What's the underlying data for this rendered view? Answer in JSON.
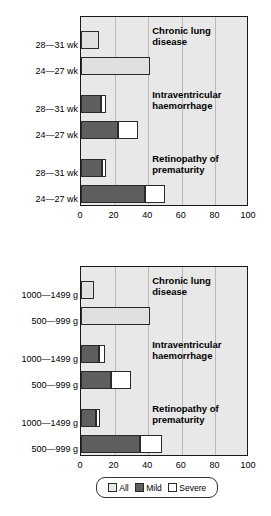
{
  "chart_data": [
    {
      "id": "top",
      "type": "bar",
      "orientation": "horizontal",
      "title": "",
      "xlabel": "",
      "ylabel": "",
      "xlim": [
        0,
        100
      ],
      "xticks": [
        0,
        20,
        40,
        60,
        80,
        100
      ],
      "grid": true,
      "legend_position": "below-figure",
      "groups": [
        {
          "annotation": "Chronic lung\ndisease",
          "rows": [
            {
              "category": "28—31 wk",
              "all": 11,
              "mild": null,
              "severe": null,
              "total": 11
            },
            {
              "category": "24—27 wk",
              "all": 41,
              "mild": null,
              "severe": null,
              "total": 41
            }
          ]
        },
        {
          "annotation": "Intraventricular\nhaemorrhage",
          "rows": [
            {
              "category": "28—31 wk",
              "all": null,
              "mild": 12,
              "severe": 3,
              "total": 15
            },
            {
              "category": "24—27 wk",
              "all": null,
              "mild": 22,
              "severe": 12,
              "total": 34
            }
          ]
        },
        {
          "annotation": "Retinopathy of\nprematurity",
          "rows": [
            {
              "category": "28—31 wk",
              "all": null,
              "mild": 12.5,
              "severe": 2.5,
              "total": 15
            },
            {
              "category": "24—27 wk",
              "all": null,
              "mild": 38,
              "severe": 12,
              "total": 50
            }
          ]
        }
      ]
    },
    {
      "id": "bottom",
      "type": "bar",
      "orientation": "horizontal",
      "title": "",
      "xlabel": "%",
      "ylabel": "",
      "xlim": [
        0,
        100
      ],
      "xticks": [
        0,
        20,
        40,
        60,
        80,
        100
      ],
      "grid": true,
      "legend_position": "below-figure",
      "groups": [
        {
          "annotation": "Chronic lung\ndisease",
          "rows": [
            {
              "category": "1000—1499 g",
              "all": 8,
              "mild": null,
              "severe": null,
              "total": 8
            },
            {
              "category": "500—999 g",
              "all": 41,
              "mild": null,
              "severe": null,
              "total": 41
            }
          ]
        },
        {
          "annotation": "Intraventricular\nhaemorrhage",
          "rows": [
            {
              "category": "1000—1499 g",
              "all": null,
              "mild": 11,
              "severe": 3,
              "total": 14
            },
            {
              "category": "500—999 g",
              "all": null,
              "mild": 18,
              "severe": 12,
              "total": 30
            }
          ]
        },
        {
          "annotation": "Retinopathy of\nprematurity",
          "rows": [
            {
              "category": "1000—1499 g",
              "all": null,
              "mild": 9,
              "severe": 2.5,
              "total": 11.5
            },
            {
              "category": "500—999 g",
              "all": null,
              "mild": 35,
              "severe": 13,
              "total": 48
            }
          ]
        }
      ]
    }
  ],
  "legend": {
    "items": [
      {
        "label": "All",
        "color": "#e8e8e8"
      },
      {
        "label": "Mild",
        "color": "#5e5e5e"
      },
      {
        "label": "Severe",
        "color": "#ffffff"
      }
    ]
  },
  "colors": {
    "plot_background": "#e8e8e8",
    "gridline": "#b9b9b9",
    "axis": "#1a1a1a",
    "all": "#e0e0e0",
    "mild": "#5e5e5e",
    "severe": "#ffffff"
  },
  "axis_title": "%"
}
